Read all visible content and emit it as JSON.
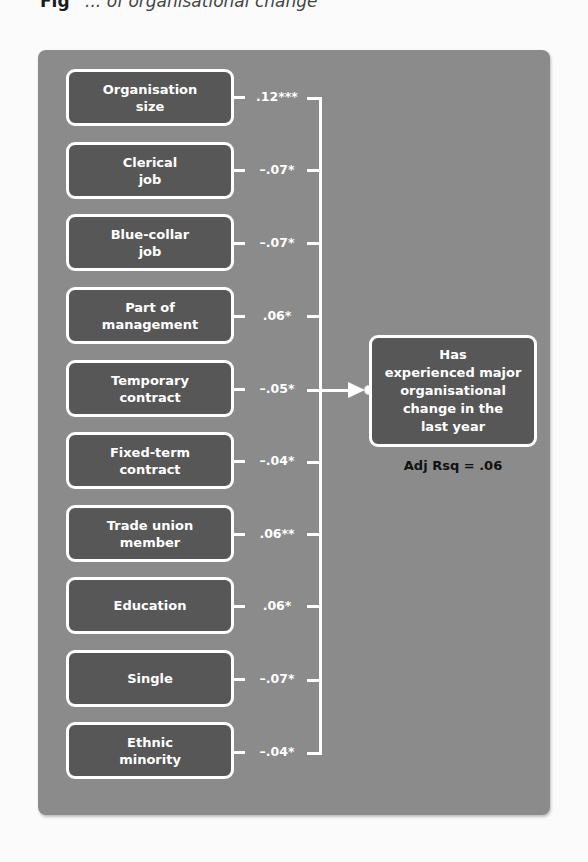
{
  "caption": {
    "figure_label": "Fig",
    "title_fragment": "... of organisational change"
  },
  "colors": {
    "panel_bg": "#8b8b8b",
    "box_fill": "#575757",
    "box_border": "#ffffff",
    "connector": "#ffffff",
    "fit_text": "#111111"
  },
  "predictors": [
    {
      "label": "Organisation\nsize",
      "coefficient": ".12***"
    },
    {
      "label": "Clerical\njob",
      "coefficient": "–.07*"
    },
    {
      "label": "Blue-collar\njob",
      "coefficient": "–.07*"
    },
    {
      "label": "Part of\nmanagement",
      "coefficient": ".06*"
    },
    {
      "label": "Temporary\ncontract",
      "coefficient": "–.05*"
    },
    {
      "label": "Fixed-term\ncontract",
      "coefficient": "–.04*"
    },
    {
      "label": "Trade union\nmember",
      "coefficient": ".06**"
    },
    {
      "label": "Education",
      "coefficient": ".06*"
    },
    {
      "label": "Single",
      "coefficient": "–.07*"
    },
    {
      "label": "Ethnic\nminority",
      "coefficient": "–.04*"
    }
  ],
  "outcome": {
    "label": "Has\nexperienced major\norganisational\nchange in the\nlast year",
    "fit_statistic": "Adj Rsq = .06"
  },
  "icons": {
    "arrow": "arrow-right-icon",
    "connector_dot": "connector-dot-icon"
  }
}
